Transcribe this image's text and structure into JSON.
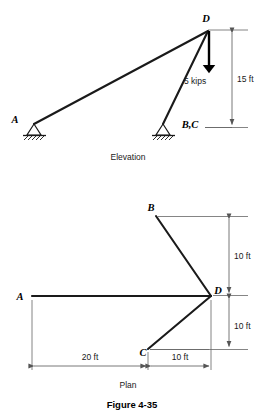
{
  "figure": {
    "caption": "Figure 4-35"
  },
  "elevation": {
    "caption": "Elevation",
    "nodes": {
      "a": "A",
      "bc": "B,C",
      "d": "D"
    },
    "load": {
      "label": "5 kips",
      "direction": "down"
    },
    "dimensions": {
      "height": "15 ft"
    },
    "supports": {
      "a_type": "pin-support",
      "bc_type": "pin-support"
    }
  },
  "plan": {
    "caption": "Plan",
    "nodes": {
      "a": "A",
      "b": "B",
      "c": "C",
      "d": "D"
    },
    "dimensions": {
      "b_to_d": "10 ft",
      "d_to_c": "10 ft",
      "a_to_c": "20 ft",
      "c_to_d": "10 ft"
    }
  },
  "colors": {
    "member": "#1a1a1a",
    "dimension": "#555555",
    "background": "#ffffff"
  }
}
